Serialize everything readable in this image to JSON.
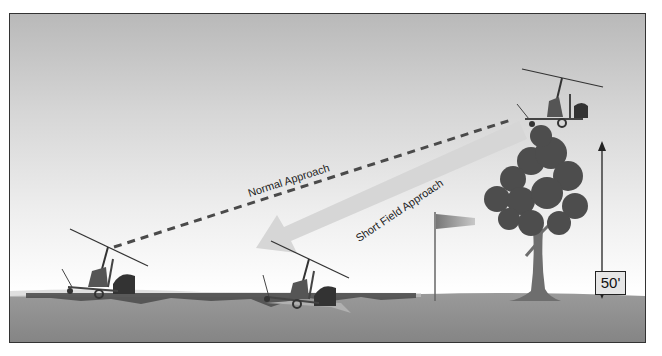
{
  "diagram": {
    "type": "gyroplane-approach-comparison",
    "labels": {
      "normal_approach": "Normal Approach",
      "short_field_approach": "Short Field Approach",
      "obstacle_height": "50'"
    },
    "elements": [
      {
        "name": "gyroplane-in-flight",
        "role": "approach start above obstacle"
      },
      {
        "name": "gyroplane-normal-touchdown",
        "role": "touchdown after normal approach"
      },
      {
        "name": "gyroplane-short-field-touchdown",
        "role": "touchdown after short field approach"
      },
      {
        "name": "tree",
        "role": "obstacle"
      },
      {
        "name": "windsock",
        "role": "wind indicator"
      },
      {
        "name": "height-arrow",
        "role": "50 ft obstacle height indicator"
      }
    ],
    "colors": {
      "sky_top": "#b9b9b9",
      "sky_bottom": "#ffffff",
      "ground": "#8a8a8a",
      "runway_shadow": "#555555",
      "dashed_path": "#4a4a4a",
      "short_field_arrow": "#d9d9d9",
      "frame": "#333333"
    }
  }
}
